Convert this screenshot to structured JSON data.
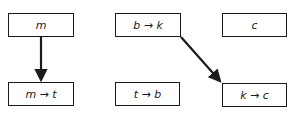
{
  "diagram": {
    "nodes": [
      {
        "id": "m",
        "label": "m",
        "x": 8,
        "y": 13,
        "w": 66,
        "h": 24
      },
      {
        "id": "b_to_k",
        "label": "b → k",
        "x": 115,
        "y": 13,
        "w": 66,
        "h": 24
      },
      {
        "id": "c",
        "label": "c",
        "x": 222,
        "y": 13,
        "w": 65,
        "h": 24
      },
      {
        "id": "m_to_t",
        "label": "m → t",
        "x": 8,
        "y": 82,
        "w": 66,
        "h": 24
      },
      {
        "id": "t_to_b",
        "label": "t → b",
        "x": 115,
        "y": 82,
        "w": 65,
        "h": 24
      },
      {
        "id": "k_to_c",
        "label": "k → c",
        "x": 222,
        "y": 83,
        "w": 65,
        "h": 24
      }
    ],
    "edges": [
      {
        "from": "m",
        "to": "m → t"
      },
      {
        "from": "b → k",
        "to": "k → c"
      }
    ],
    "colors": {
      "stroke": "#1a1a1a",
      "background": "#ffffff"
    }
  }
}
